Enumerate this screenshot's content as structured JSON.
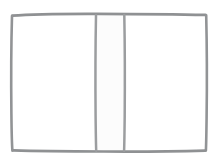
{
  "meta": {
    "canvas_width": 222,
    "canvas_height": 162,
    "background_color": "#ffffff"
  },
  "drawing": {
    "style": "hand-drawn pencil line art",
    "stroke_color": "#8f9193",
    "stroke_color_light": "#a9abad",
    "stroke_width": 2.6,
    "fill_page": "#ffffff",
    "fill_spine": "#fcfcfc",
    "shapes": [
      {
        "name": "book-outer-outline",
        "type": "rectangle",
        "x": 11,
        "y": 14,
        "width": 196,
        "height": 137,
        "label": "outer book cover rectangle"
      },
      {
        "name": "book-spine-strip",
        "type": "rectangle",
        "x": 95,
        "y": 15,
        "width": 30,
        "height": 136,
        "label": "center vertical spine strip"
      },
      {
        "name": "left-page",
        "type": "region",
        "x": 13,
        "y": 16,
        "width": 82,
        "height": 134,
        "label": "left blank page"
      },
      {
        "name": "right-page",
        "type": "region",
        "x": 125,
        "y": 16,
        "width": 80,
        "height": 134,
        "label": "right blank page"
      }
    ],
    "text_content": []
  },
  "a11y": {
    "figure_description": "A simple grey hand-drawn outline of an open book: a large rectangle divided by a narrow vertical strip down the middle forming the spine, with two blank pages on either side."
  }
}
